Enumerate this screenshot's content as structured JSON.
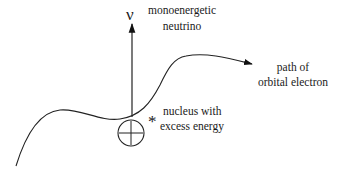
{
  "diagram": {
    "neutrino_symbol": "ν",
    "neutrino_label": [
      "monoenergetic",
      "neutrino"
    ],
    "electron_label": [
      "path of",
      "orbital electron"
    ],
    "nucleus_label": [
      "nucleus with",
      "excess energy"
    ],
    "excited_marker": "*",
    "nucleus_sign": "+"
  }
}
